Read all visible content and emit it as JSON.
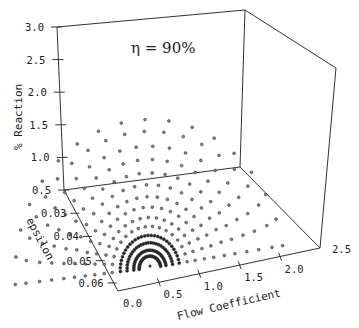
{
  "chart_data": {
    "type": "scatter",
    "projection": "3d",
    "title": "",
    "annotation": "η = 90%",
    "xlabel": "Flow Coefficient",
    "ylabel": "epsilon",
    "zlabel": "% Reaction",
    "x_ticks": [
      "0.0",
      "0.5",
      "1.0",
      "1.5",
      "2.0",
      "2.5"
    ],
    "y_ticks": [
      "0.03",
      "0.04",
      "0.05",
      "0.06"
    ],
    "z_ticks": [
      "0.5",
      "1.0",
      "1.5",
      "2.0",
      "2.5",
      "3.0"
    ],
    "xlim": [
      0.0,
      2.5
    ],
    "ylim": [
      0.03,
      0.06
    ],
    "zlim": [
      0.5,
      3.0
    ],
    "grid": false,
    "legend": null,
    "marker": "open-circle",
    "arcs": [
      {
        "radius": 0.04,
        "points": 1
      },
      {
        "radius": 0.08,
        "points": 9
      },
      {
        "radius": 0.12,
        "points": 11
      },
      {
        "radius": 0.17,
        "points": 13
      },
      {
        "radius": 0.22,
        "points": 15
      },
      {
        "radius": 0.28,
        "points": 17
      },
      {
        "radius": 0.34,
        "points": 18
      },
      {
        "radius": 0.41,
        "points": 19
      },
      {
        "radius": 0.48,
        "points": 20
      },
      {
        "radius": 0.56,
        "points": 20
      },
      {
        "radius": 0.64,
        "points": 21
      },
      {
        "radius": 0.73,
        "points": 21
      },
      {
        "radius": 0.82,
        "points": 21
      },
      {
        "radius": 0.92,
        "points": 20
      },
      {
        "radius": 1.0,
        "points": 18
      }
    ]
  },
  "axes": {
    "z_label": "% Reaction",
    "y_label": "epsilon",
    "x_label": "Flow Coefficient",
    "annotation": "η = 90%"
  }
}
